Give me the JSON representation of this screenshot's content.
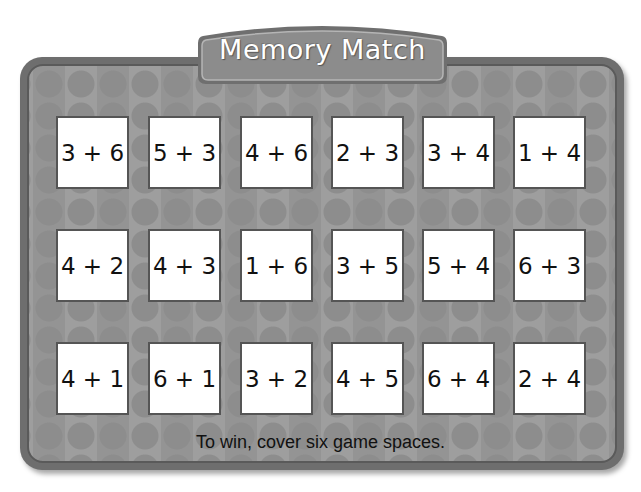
{
  "title": "Memory Match",
  "cards": [
    [
      "3 + 6",
      "5 + 3",
      "4 + 6",
      "2 + 3",
      "3 + 4",
      "1 + 4"
    ],
    [
      "4 + 2",
      "4 + 3",
      "1 + 6",
      "3 + 5",
      "5 + 4",
      "6 + 3"
    ],
    [
      "4 + 1",
      "6 + 1",
      "3 + 2",
      "4 + 5",
      "6 + 4",
      "2 + 4"
    ]
  ],
  "instructions": "To win, cover six game spaces.",
  "colors": {
    "board_frame": "#6e6e6e",
    "board_fill": "#9a9a9a",
    "banner_fill": "#8c8c8c",
    "card_fill": "#ffffff",
    "card_border": "#555555"
  }
}
